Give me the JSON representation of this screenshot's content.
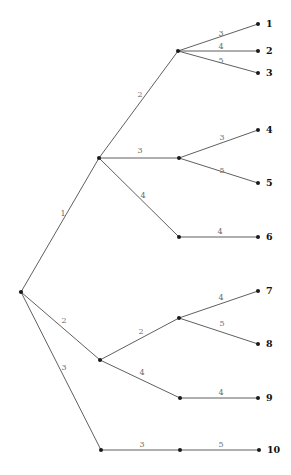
{
  "diagram": {
    "type": "tree",
    "background_color": "#ffffff",
    "edge_color": "#4d4d4d",
    "node_color": "#1a1a1a",
    "weight_label_color": "#6b6b6b",
    "leaf_label_color": "#111111",
    "nodes": [
      {
        "id": "root",
        "x": 21,
        "y": 292,
        "kind": "root"
      },
      {
        "id": "a",
        "x": 99,
        "y": 158,
        "kind": "internal"
      },
      {
        "id": "b",
        "x": 100,
        "y": 360,
        "kind": "internal"
      },
      {
        "id": "a1",
        "x": 178,
        "y": 51,
        "kind": "internal"
      },
      {
        "id": "a2",
        "x": 179,
        "y": 158,
        "kind": "internal"
      },
      {
        "id": "a3",
        "x": 179,
        "y": 237,
        "kind": "internal"
      },
      {
        "id": "b1",
        "x": 179,
        "y": 318,
        "kind": "internal"
      },
      {
        "id": "b2",
        "x": 180,
        "y": 398,
        "kind": "internal"
      },
      {
        "id": "c",
        "x": 101,
        "y": 450,
        "kind": "internal"
      },
      {
        "id": "c1",
        "x": 180,
        "y": 450,
        "kind": "internal"
      },
      {
        "id": "leaf1",
        "x": 258,
        "y": 24,
        "kind": "leaf"
      },
      {
        "id": "leaf2",
        "x": 258,
        "y": 51,
        "kind": "leaf"
      },
      {
        "id": "leaf3",
        "x": 258,
        "y": 73,
        "kind": "leaf"
      },
      {
        "id": "leaf4",
        "x": 258,
        "y": 130,
        "kind": "leaf"
      },
      {
        "id": "leaf5",
        "x": 258,
        "y": 183,
        "kind": "leaf"
      },
      {
        "id": "leaf6",
        "x": 258,
        "y": 237,
        "kind": "leaf"
      },
      {
        "id": "leaf7",
        "x": 258,
        "y": 291,
        "kind": "leaf"
      },
      {
        "id": "leaf8",
        "x": 258,
        "y": 344,
        "kind": "leaf"
      },
      {
        "id": "leaf9",
        "x": 258,
        "y": 398,
        "kind": "leaf"
      },
      {
        "id": "leaf10",
        "x": 259,
        "y": 450,
        "kind": "leaf"
      }
    ],
    "edges": [
      {
        "from": "root",
        "to": "a",
        "weight": "1",
        "lx": 63,
        "ly": 216
      },
      {
        "from": "root",
        "to": "b",
        "weight": "2",
        "lx": 64,
        "ly": 323
      },
      {
        "from": "root",
        "to": "c",
        "weight": "3",
        "lx": 64,
        "ly": 370
      },
      {
        "from": "a",
        "to": "a1",
        "weight": "2",
        "lx": 140,
        "ly": 97
      },
      {
        "from": "a",
        "to": "a2",
        "weight": "3",
        "lx": 140,
        "ly": 153
      },
      {
        "from": "a",
        "to": "a3",
        "weight": "4",
        "lx": 143,
        "ly": 198
      },
      {
        "from": "a1",
        "to": "leaf1",
        "weight": "3",
        "lx": 221,
        "ly": 36
      },
      {
        "from": "a1",
        "to": "leaf2",
        "weight": "4",
        "lx": 221,
        "ly": 49
      },
      {
        "from": "a1",
        "to": "leaf3",
        "weight": "5",
        "lx": 221,
        "ly": 63
      },
      {
        "from": "a2",
        "to": "leaf4",
        "weight": "3",
        "lx": 222,
        "ly": 140
      },
      {
        "from": "a2",
        "to": "leaf5",
        "weight": "5",
        "lx": 222,
        "ly": 173
      },
      {
        "from": "a3",
        "to": "leaf6",
        "weight": "4",
        "lx": 220,
        "ly": 234
      },
      {
        "from": "b",
        "to": "b1",
        "weight": "2",
        "lx": 141,
        "ly": 334
      },
      {
        "from": "b",
        "to": "b2",
        "weight": "4",
        "lx": 142,
        "ly": 375
      },
      {
        "from": "b1",
        "to": "leaf7",
        "weight": "4",
        "lx": 221,
        "ly": 300
      },
      {
        "from": "b1",
        "to": "leaf8",
        "weight": "5",
        "lx": 222,
        "ly": 326
      },
      {
        "from": "b2",
        "to": "leaf9",
        "weight": "4",
        "lx": 221,
        "ly": 395
      },
      {
        "from": "c",
        "to": "c1",
        "weight": "3",
        "lx": 142,
        "ly": 447
      },
      {
        "from": "c1",
        "to": "leaf10",
        "weight": "5",
        "lx": 221,
        "ly": 447
      }
    ],
    "leaf_labels": [
      {
        "node": "leaf1",
        "text": "1",
        "x": 266,
        "y": 24
      },
      {
        "node": "leaf2",
        "text": "2",
        "x": 266,
        "y": 51
      },
      {
        "node": "leaf3",
        "text": "3",
        "x": 266,
        "y": 73
      },
      {
        "node": "leaf4",
        "text": "4",
        "x": 266,
        "y": 130
      },
      {
        "node": "leaf5",
        "text": "5",
        "x": 266,
        "y": 183
      },
      {
        "node": "leaf6",
        "text": "6",
        "x": 266,
        "y": 237
      },
      {
        "node": "leaf7",
        "text": "7",
        "x": 266,
        "y": 291
      },
      {
        "node": "leaf8",
        "text": "8",
        "x": 266,
        "y": 344
      },
      {
        "node": "leaf9",
        "text": "9",
        "x": 266,
        "y": 398
      },
      {
        "node": "leaf10",
        "text": "10",
        "x": 267,
        "y": 450
      }
    ]
  }
}
